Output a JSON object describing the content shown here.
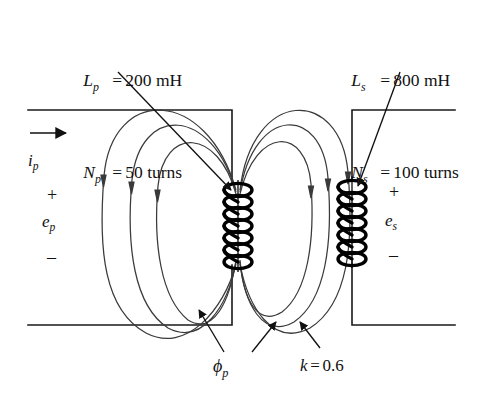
{
  "figure": {
    "background_color": "#ffffff",
    "line_color": "#1a1a1a",
    "flux_line_color": "#3a3a3a",
    "coil_color": "#000000",
    "width": 478,
    "height": 399
  },
  "labels": {
    "primary_params": {
      "inductance": {
        "symbol": "L",
        "subscript": "p",
        "equals": "=",
        "value": "200 mH"
      },
      "turns": {
        "symbol": "N",
        "subscript": "p",
        "equals": "=",
        "value": "50 turns"
      }
    },
    "secondary_params": {
      "inductance": {
        "symbol": "L",
        "subscript": "s",
        "equals": "=",
        "value": "800 mH"
      },
      "turns": {
        "symbol": "N",
        "subscript": "s",
        "equals": "=",
        "value": "100 turns"
      }
    },
    "primary_current": {
      "symbol": "i",
      "subscript": "p"
    },
    "primary_voltage": {
      "plus": "+",
      "symbol": "e",
      "subscript": "p",
      "minus": "–"
    },
    "secondary_voltage": {
      "plus": "+",
      "symbol": "e",
      "subscript": "s",
      "minus": "–"
    },
    "flux": {
      "symbol": "ϕ",
      "subscript": "p"
    },
    "coupling": {
      "symbol": "k",
      "equals": "=",
      "value": "0.6"
    }
  },
  "annotations": {
    "primary_coil_name": "primary-coil",
    "secondary_coil_name": "secondary-coil",
    "primary_turns_count": 8,
    "secondary_turns_count": 7,
    "flux_loops_left": 3,
    "flux_loops_right": 3,
    "current_arrow_direction": "right"
  }
}
